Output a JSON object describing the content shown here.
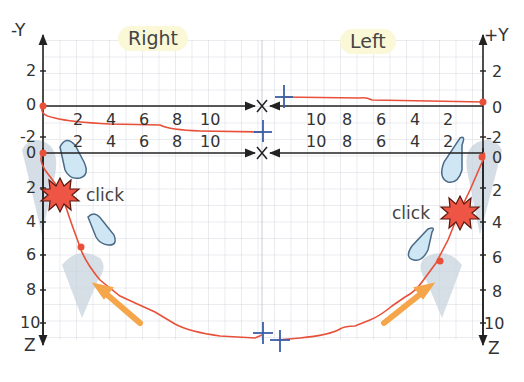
{
  "diagram": {
    "title_left_panel": "Right",
    "title_right_panel": "Left",
    "axes": {
      "left_top_y_label": "-Y",
      "right_top_y_label": "+Y",
      "x_label": "X",
      "z_label": "Z",
      "upper_y_ticks_left": [
        "2",
        "0",
        "-2"
      ],
      "upper_y_ticks_right": [
        "2",
        "0",
        "-2"
      ],
      "z_ticks": [
        "0",
        "2",
        "4",
        "6",
        "8",
        "10"
      ],
      "x_ticks_left": [
        "2",
        "4",
        "6",
        "8",
        "10"
      ],
      "x_ticks_right": [
        "10",
        "8",
        "6",
        "4",
        "2"
      ]
    },
    "annotations": {
      "click_left": "click",
      "click_right": "click"
    },
    "colors": {
      "trace": "#e8503a",
      "grid": "#d5d8e0",
      "axis": "#222222",
      "marker_cross": "#3a5fa8",
      "hand_fill": "#cfe6f5",
      "hand_stroke": "#4a6a86",
      "finger_shadow": "#c8d4de",
      "arrow": "#f5a54a",
      "burst": "#ee5544",
      "header_bg": "#fbf8d8"
    }
  }
}
